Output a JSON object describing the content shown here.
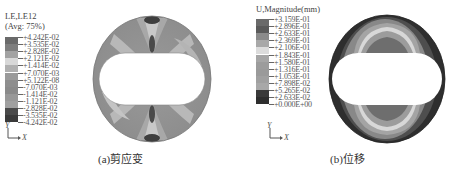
{
  "panels": [
    {
      "id": "a",
      "caption": "(a)剪应变",
      "legend": {
        "title_line1": "LE,LE12",
        "title_line2": "(Avg: 75%)",
        "labels": [
          "+4.242E-02",
          "+3.535E-02",
          "+2.828E-02",
          "+2.121E-02",
          "+1.414E-02",
          "+7.070E-03",
          "+5.122E-08",
          "-7.070E-03",
          "-1.414E-02",
          "-1.121E-02",
          "-2.828E-02",
          "-3.535E-02",
          "-4.242E-02"
        ],
        "colors": [
          "#6a6a6a",
          "#7e7e7e",
          "#a2a2a2",
          "#d8d8d8",
          "#b0b0b0",
          "#9a9a9a",
          "#8e8e8e",
          "#8a8a8a",
          "#989898",
          "#a0a0a0",
          "#4a4a4a",
          "#3a3a3a"
        ]
      },
      "axis": {
        "y": "Y",
        "x": "X"
      }
    },
    {
      "id": "b",
      "caption": "(b)位移",
      "legend": {
        "title_line1": "U,Magnitude(mm)",
        "labels": [
          "+3.159E-01",
          "+2.896E-01",
          "+2.633E-01",
          "+2.369E-01",
          "+2.106E-01",
          "+1.843E-01",
          "+1.580E-01",
          "+1.316E-01",
          "+1.053E-01",
          "+7.898E-02",
          "+5.265E-02",
          "+2.633E-02",
          "+0.000E+00"
        ],
        "colors": [
          "#6a6a6a",
          "#5a5a5a",
          "#8a8a8a",
          "#a8a8a8",
          "#dcdcdc",
          "#a6a6a6",
          "#9c9c9c",
          "#9a9a9a",
          "#a0a0a0",
          "#a8a8a8",
          "#3a3a3a",
          "#2e2e2e"
        ]
      },
      "axis": {
        "y": "Y",
        "x": "X"
      }
    }
  ]
}
